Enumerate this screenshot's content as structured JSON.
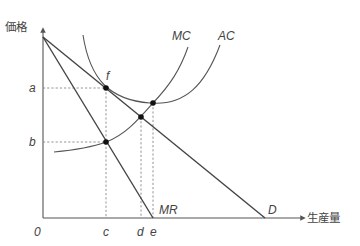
{
  "axes": {
    "y_label": "価格",
    "x_label": "生産量",
    "origin_label": "0"
  },
  "curves": {
    "mc_label": "MC",
    "ac_label": "AC",
    "mr_label": "MR",
    "d_label": "D"
  },
  "price_levels": {
    "a": "a",
    "b": "b"
  },
  "quantity_levels": {
    "c": "c",
    "d": "d",
    "e": "e"
  },
  "points": {
    "f": "f"
  },
  "colors": {
    "line": "#555555",
    "guide": "#888888",
    "point": "#111111"
  }
}
